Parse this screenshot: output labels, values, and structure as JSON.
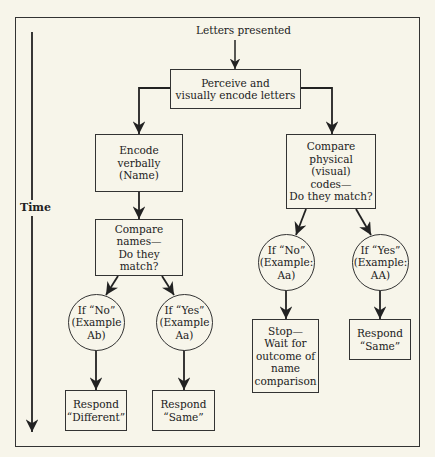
{
  "diagram": {
    "start_label": "Letters presented",
    "time_axis_label": "Time",
    "nodes": {
      "perceive": "Perceive and\nvisually encode letters",
      "encode_verbally": "Encode\nverbally\n(Name)",
      "compare_names": "Compare\nnames—\nDo they\nmatch?",
      "compare_physical": "Compare\nphysical\n(visual)\ncodes—\nDo they match?",
      "names_no": "If “No”\n(Example\nAb)",
      "names_yes": "If “Yes”\n(Example\nAa)",
      "physical_no": "If “No”\n(Example:\nAa)",
      "physical_yes": "If “Yes”\n(Example:\nAA)",
      "respond_different": "Respond\n“Different”",
      "respond_same_names": "Respond\n“Same”",
      "stop_wait": "Stop—\nWait for\noutcome of\nname\ncomparison",
      "respond_same_physical": "Respond\n“Same”"
    },
    "edges": [
      [
        "start",
        "perceive"
      ],
      [
        "perceive",
        "encode_verbally"
      ],
      [
        "perceive",
        "compare_physical"
      ],
      [
        "encode_verbally",
        "compare_names"
      ],
      [
        "compare_names",
        "names_no"
      ],
      [
        "compare_names",
        "names_yes"
      ],
      [
        "names_no",
        "respond_different"
      ],
      [
        "names_yes",
        "respond_same_names"
      ],
      [
        "compare_physical",
        "physical_no"
      ],
      [
        "compare_physical",
        "physical_yes"
      ],
      [
        "physical_no",
        "stop_wait"
      ],
      [
        "physical_yes",
        "respond_same_physical"
      ]
    ],
    "colors": {
      "background": "#f7f5ea",
      "line": "#222222"
    }
  }
}
